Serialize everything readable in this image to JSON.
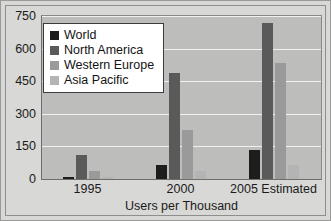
{
  "chart_data": {
    "type": "bar",
    "title": "",
    "xlabel": "Users per Thousand",
    "ylabel": "",
    "categories": [
      "1995",
      "2000",
      "2005 Estimated"
    ],
    "series": [
      {
        "name": "World",
        "color": "#1d1d1d",
        "values": [
          10,
          65,
          135
        ]
      },
      {
        "name": "North America",
        "color": "#5a5a5a",
        "values": [
          110,
          490,
          720
        ]
      },
      {
        "name": "Western Europe",
        "color": "#9a9a9a",
        "values": [
          35,
          225,
          535
        ]
      },
      {
        "name": "Asia Pacific",
        "color": "#b4b4b4",
        "values": [
          8,
          35,
          65
        ]
      }
    ],
    "ylim": [
      0,
      750
    ],
    "yticks": [
      0,
      150,
      300,
      450,
      600,
      750
    ],
    "ytick_labels": [
      "0",
      "150",
      "300",
      "450",
      "600",
      "750"
    ],
    "grid": true,
    "legend_position": "top-left",
    "plot_background": "#bdbdbb",
    "gridline_color": "#f1f1ef",
    "figure_background": "#d8d8d6"
  }
}
